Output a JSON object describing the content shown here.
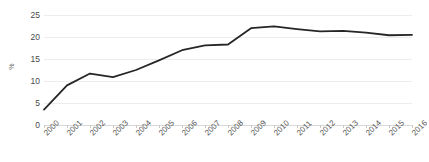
{
  "chart_data": {
    "type": "line",
    "title": "",
    "subtitle": "",
    "xlabel": "",
    "ylabel": "%",
    "categories": [
      "2000",
      "2001",
      "2002",
      "2003",
      "2004",
      "2005",
      "2006",
      "2007",
      "2008",
      "2009",
      "2010",
      "2011",
      "2012",
      "2013",
      "2014",
      "2015",
      "2016"
    ],
    "values": [
      3.5,
      9.0,
      11.7,
      10.9,
      12.5,
      14.7,
      17.0,
      18.1,
      18.3,
      22.0,
      22.4,
      21.8,
      21.3,
      21.4,
      21.0,
      20.4,
      20.5
    ],
    "series": [
      {
        "name": "",
        "values": [
          3.5,
          9.0,
          11.7,
          10.9,
          12.5,
          14.7,
          17.0,
          18.1,
          18.3,
          22.0,
          22.4,
          21.8,
          21.3,
          21.4,
          21.0,
          20.4,
          20.5
        ]
      }
    ],
    "ylim": [
      0,
      25
    ],
    "yticks": [
      0,
      5,
      10,
      15,
      20,
      25
    ],
    "ytick_labels": [
      "0",
      "5",
      "10",
      "15",
      "20",
      "25"
    ],
    "grid": true,
    "grid_axis": "y",
    "legend": false,
    "legend_position": "none",
    "line_color": "#262626",
    "grid_color": "#ececec",
    "axis_color": "#d8d8d8",
    "background_color": "#ffffff",
    "tick_label_color": "#4a4a4a",
    "xtick_rotation": -45
  }
}
